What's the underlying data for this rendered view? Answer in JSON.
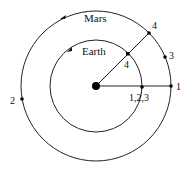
{
  "diagram": {
    "sun": {
      "cx": 96,
      "cy": 86,
      "r": 4
    },
    "orbits": [
      {
        "name": "Mars",
        "label": "Mars",
        "r": 75,
        "label_x": 84,
        "label_y": 22
      },
      {
        "name": "Earth",
        "label": "Earth",
        "r": 46,
        "label_x": 82,
        "label_y": 55
      }
    ],
    "points": [
      {
        "label": "1",
        "x": 171,
        "y": 86,
        "lx": 177,
        "ly": 90
      },
      {
        "label": "2",
        "x": 22,
        "y": 99,
        "lx": 10,
        "ly": 104
      },
      {
        "label": "3",
        "x": 165,
        "y": 57,
        "lx": 170,
        "ly": 59
      },
      {
        "label": "4",
        "x": 149,
        "y": 33,
        "lx": 152,
        "ly": 29
      },
      {
        "label": "4",
        "x": 128,
        "y": 54,
        "lx": 124,
        "ly": 68
      },
      {
        "label": "1,2,3",
        "x": 141,
        "y": 87,
        "lx": 129,
        "ly": 101
      }
    ],
    "lines": [
      {
        "x1": 96,
        "y1": 86,
        "x2": 171,
        "y2": 86
      },
      {
        "x1": 96,
        "y1": 86,
        "x2": 149,
        "y2": 33
      }
    ]
  }
}
